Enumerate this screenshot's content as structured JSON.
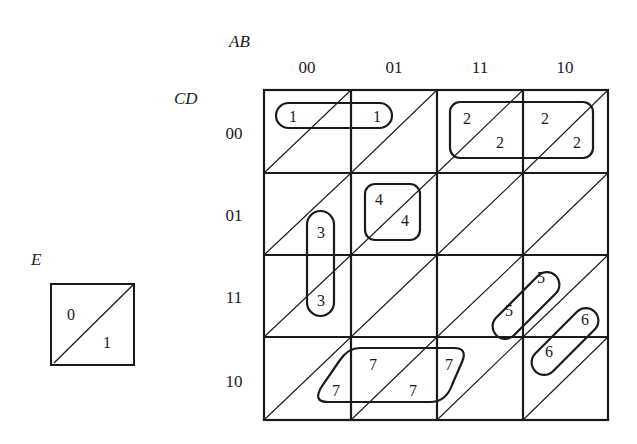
{
  "kmap": {
    "col_var_label": "AB",
    "row_var_label": "CD",
    "col_labels": [
      "00",
      "01",
      "11",
      "10"
    ],
    "row_labels": [
      "00",
      "01",
      "11",
      "10"
    ],
    "cells_note": "each cell split diagonally: upper-left = E=0, lower-right = E=1",
    "groups": [
      {
        "id": 1,
        "label": "1",
        "cells": [
          "CD00-AB00-E0",
          "CD00-AB01-E0"
        ]
      },
      {
        "id": 2,
        "label": "2",
        "cells": [
          "CD00-AB11-E0",
          "CD00-AB11-E1",
          "CD00-AB10-E0",
          "CD00-AB10-E1"
        ]
      },
      {
        "id": 3,
        "label": "3",
        "cells": [
          "CD01-AB00-E1",
          "CD11-AB00-E1"
        ]
      },
      {
        "id": 4,
        "label": "4",
        "cells": [
          "CD01-AB01-E0",
          "CD01-AB01-E1"
        ]
      },
      {
        "id": 5,
        "label": "5",
        "cells": [
          "CD11-AB11-E1",
          "CD11-AB10-E0"
        ]
      },
      {
        "id": 6,
        "label": "6",
        "cells": [
          "CD11-AB10-E1",
          "CD10-AB10-E0"
        ]
      },
      {
        "id": 7,
        "label": "7",
        "cells": [
          "CD10-AB00-E1",
          "CD10-AB01-E0",
          "CD10-AB01-E1",
          "CD10-AB11-E0"
        ]
      }
    ]
  },
  "legend": {
    "var_label": "E",
    "upper_value": "0",
    "lower_value": "1"
  }
}
